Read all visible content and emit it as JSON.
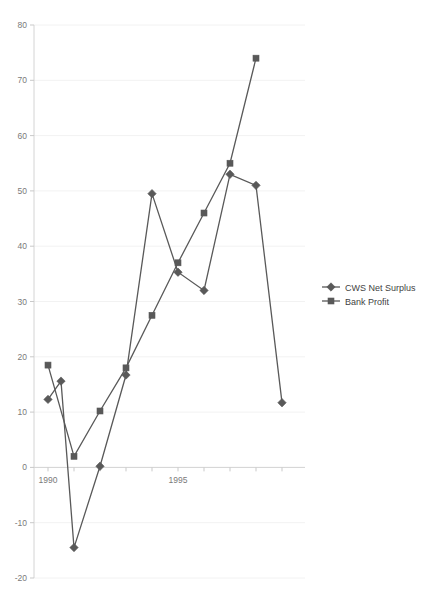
{
  "chart_data": {
    "type": "line",
    "title": "",
    "xlabel": "",
    "ylabel": "",
    "x": [
      1990,
      1991,
      1992,
      1993,
      1994,
      1995,
      1996,
      1997,
      1998,
      1999
    ],
    "xlim": [
      1989.5,
      1999.8
    ],
    "ylim": [
      -20,
      80
    ],
    "yticks": [
      -20,
      -10,
      0,
      10,
      20,
      30,
      40,
      50,
      60,
      70,
      80
    ],
    "ytick_labels": [
      "-20",
      "-10",
      "0",
      "10",
      "20",
      "30",
      "40",
      "50",
      "60",
      "70",
      "80"
    ],
    "xticks": [
      1990,
      1991,
      1992,
      1993,
      1994,
      1995,
      1996,
      1997,
      1998,
      1999
    ],
    "xtick_labels": [
      "1990",
      "",
      "",
      "",
      "",
      "1995",
      "",
      "",
      "",
      ""
    ],
    "grid": true,
    "legend_position": "right",
    "series": [
      {
        "name": "CWS Net Surplus",
        "marker": "diamond",
        "color": "#595959",
        "x": [
          1990,
          1990.5,
          1991,
          1992,
          1993,
          1994,
          1995,
          1996,
          1997,
          1998,
          1999
        ],
        "values": [
          12.3,
          15.6,
          -14.5,
          0.2,
          16.7,
          49.5,
          35.3,
          32.0,
          53.0,
          51.0,
          11.7
        ]
      },
      {
        "name": "Bank Profit",
        "marker": "square",
        "color": "#595959",
        "x": [
          1990,
          1991,
          1992,
          1993,
          1994,
          1995,
          1996,
          1997,
          1998
        ],
        "values": [
          18.5,
          2.0,
          10.2,
          18.0,
          27.5,
          37.0,
          46.0,
          55.0,
          74.0
        ]
      }
    ]
  },
  "legend": {
    "items": [
      {
        "label": "CWS Net Surplus",
        "marker": "diamond-marker-icon"
      },
      {
        "label": "Bank Profit",
        "marker": "square-marker-icon"
      }
    ]
  }
}
